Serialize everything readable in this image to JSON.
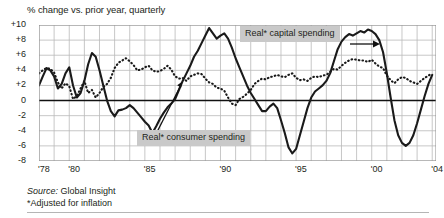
{
  "figure": {
    "subtitle": "% change vs. prior year, quarterly",
    "source_prefix": "Source:",
    "source_value": " Global Insight",
    "footnote": "*Adjusted for inflation"
  },
  "annotations": {
    "capital": "Real* capital spending",
    "consumer": "Real* consumer spending"
  },
  "chart_data": {
    "type": "line",
    "title": "",
    "subtitle": "% change vs. prior year, quarterly",
    "xlabel": "",
    "ylabel": "% change vs. prior year",
    "ylim": [
      -8,
      10
    ],
    "yticks": [
      10,
      8,
      6,
      4,
      2,
      0,
      -2,
      -4,
      -6,
      -8
    ],
    "ytick_labels": [
      "+10",
      "+8",
      "+6",
      "+4",
      "+2",
      "0",
      "-2",
      "-4",
      "-6",
      "-8"
    ],
    "xlim": [
      1978.0,
      2004.25
    ],
    "xticks": [
      1978,
      1980,
      1985,
      1990,
      1995,
      2000,
      2004
    ],
    "xtick_labels": [
      "'78",
      "'80",
      "'85",
      "'90",
      "'95",
      "'00",
      "'04"
    ],
    "grid": true,
    "gridlines_x_every": 1,
    "zero_line": true,
    "legend": "annotated-callouts",
    "x": [
      1978.0,
      1978.25,
      1978.5,
      1978.75,
      1979.0,
      1979.25,
      1979.5,
      1979.75,
      1980.0,
      1980.25,
      1980.5,
      1980.75,
      1981.0,
      1981.25,
      1981.5,
      1981.75,
      1982.0,
      1982.25,
      1982.5,
      1982.75,
      1983.0,
      1983.25,
      1983.5,
      1983.75,
      1984.0,
      1984.25,
      1984.5,
      1984.75,
      1985.0,
      1985.25,
      1985.5,
      1985.75,
      1986.0,
      1986.25,
      1986.5,
      1986.75,
      1987.0,
      1987.25,
      1987.5,
      1987.75,
      1988.0,
      1988.25,
      1988.5,
      1988.75,
      1989.0,
      1989.25,
      1989.5,
      1989.75,
      1990.0,
      1990.25,
      1990.5,
      1990.75,
      1991.0,
      1991.25,
      1991.5,
      1991.75,
      1992.0,
      1992.25,
      1992.5,
      1992.75,
      1993.0,
      1993.25,
      1993.5,
      1993.75,
      1994.0,
      1994.25,
      1994.5,
      1994.75,
      1995.0,
      1995.25,
      1995.5,
      1995.75,
      1996.0,
      1996.25,
      1996.5,
      1996.75,
      1997.0,
      1997.25,
      1997.5,
      1997.75,
      1998.0,
      1998.25,
      1998.5,
      1998.75,
      1999.0,
      1999.25,
      1999.5,
      1999.75,
      2000.0,
      2000.25,
      2000.5,
      2000.75,
      2001.0,
      2001.25,
      2001.5,
      2001.75,
      2002.0,
      2002.25,
      2002.5,
      2002.75,
      2003.0,
      2003.25,
      2003.5,
      2003.75,
      2004.0
    ],
    "series": [
      {
        "name": "Real* consumer spending",
        "style": "solid",
        "color": "#1a1a1a",
        "values": [
          3.6,
          4.0,
          4.3,
          4.2,
          3.7,
          2.4,
          1.6,
          2.3,
          1.9,
          0.2,
          0.6,
          1.6,
          2.6,
          1.0,
          1.4,
          0.4,
          1.0,
          1.8,
          2.2,
          3.0,
          4.3,
          5.0,
          5.3,
          5.6,
          5.2,
          4.7,
          4.0,
          4.1,
          4.4,
          4.6,
          4.0,
          3.8,
          3.9,
          4.2,
          4.6,
          4.1,
          3.2,
          2.9,
          3.0,
          2.6,
          3.2,
          3.4,
          3.6,
          3.5,
          2.9,
          2.4,
          2.2,
          1.7,
          1.6,
          1.3,
          0.4,
          -0.4,
          -0.6,
          0.2,
          0.5,
          0.9,
          1.4,
          2.2,
          2.6,
          2.9,
          2.8,
          3.1,
          3.2,
          3.4,
          3.2,
          3.1,
          3.4,
          3.6,
          3.0,
          2.7,
          2.8,
          2.6,
          3.0,
          3.2,
          3.1,
          3.3,
          3.4,
          3.8,
          4.2,
          4.1,
          4.6,
          5.0,
          5.3,
          5.5,
          5.4,
          5.3,
          5.3,
          5.1,
          5.4,
          4.9,
          4.5,
          4.3,
          3.3,
          2.7,
          2.3,
          2.8,
          3.1,
          3.0,
          2.6,
          2.4,
          2.2,
          2.6,
          3.0,
          3.3,
          3.6
        ]
      },
      {
        "name": "Real* capital spending",
        "style": "dotted",
        "color": "#1a1a1a",
        "values": [
          2.0,
          3.2,
          4.3,
          4.0,
          3.2,
          1.6,
          2.2,
          3.6,
          4.4,
          2.0,
          0.4,
          1.0,
          2.6,
          4.8,
          6.3,
          5.8,
          4.0,
          2.0,
          0.0,
          -1.4,
          -2.1,
          -1.3,
          -1.2,
          -1.0,
          -0.6,
          -1.0,
          -1.6,
          -2.2,
          -2.8,
          -3.3,
          -4.3,
          -3.4,
          -2.4,
          -1.6,
          -0.9,
          -0.4,
          0.2,
          1.4,
          2.6,
          3.6,
          4.6,
          5.8,
          6.6,
          7.6,
          8.6,
          9.6,
          8.9,
          8.2,
          8.6,
          8.9,
          8.2,
          7.0,
          5.6,
          4.4,
          3.2,
          2.0,
          1.0,
          0.2,
          -0.6,
          -1.4,
          -1.4,
          -0.8,
          -0.4,
          -1.0,
          -2.6,
          -4.3,
          -6.2,
          -7.0,
          -6.4,
          -4.6,
          -2.8,
          -1.0,
          0.4,
          1.2,
          1.6,
          2.0,
          2.6,
          3.6,
          5.2,
          6.8,
          7.8,
          8.4,
          8.8,
          8.6,
          8.9,
          9.2,
          9.0,
          9.4,
          9.2,
          8.8,
          8.0,
          6.4,
          3.6,
          0.4,
          -2.6,
          -4.6,
          -5.6,
          -6.0,
          -5.6,
          -4.6,
          -3.0,
          -1.2,
          0.6,
          2.2,
          3.4
        ]
      }
    ]
  }
}
